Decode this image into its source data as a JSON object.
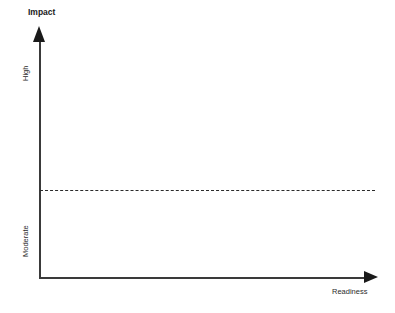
{
  "chart_data": {
    "type": "scatter",
    "title": "",
    "xlabel": "Readiness",
    "ylabel": "Impact",
    "x": [],
    "y": [],
    "series": [],
    "categories": [],
    "values": [],
    "xlim": [
      0,
      1
    ],
    "ylim": [
      0,
      1
    ],
    "grid": false,
    "legend": null,
    "y_tick_labels": [
      "Moderate",
      "High"
    ],
    "x_tick_labels": [],
    "annotations": [
      {
        "name": "threshold-line",
        "kind": "horizontal-dashed-reference-line",
        "label": "",
        "y_position_fraction": 0.37,
        "style": "dashed"
      }
    ]
  },
  "axes": {
    "y_title": "Impact",
    "x_title": "Readiness",
    "y_ticks": [
      {
        "label": "High"
      },
      {
        "label": "Moderate"
      }
    ]
  },
  "colors": {
    "background": "#ffffff",
    "axis": "#3a3a3a",
    "arrowhead": "#1a1a1a",
    "dashed_line": "#2b2b2b",
    "text": "#1a1a1a"
  }
}
